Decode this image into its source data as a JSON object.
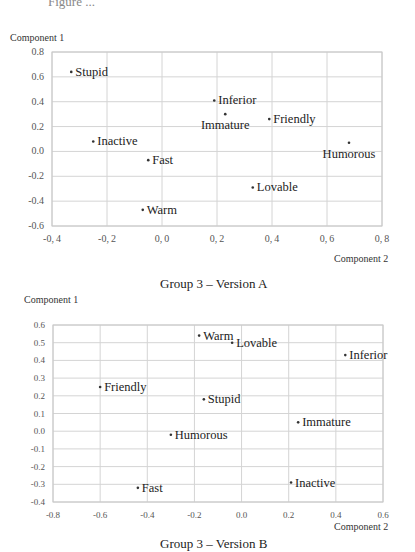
{
  "page": {
    "cutoff_text": "Figure ..."
  },
  "chart_data": [
    {
      "type": "scatter",
      "title": "Group 3 – Version A",
      "xlabel": "Component 2",
      "ylabel": "Component 1",
      "xlim": [
        -0.4,
        0.8
      ],
      "ylim": [
        -0.6,
        0.8
      ],
      "xticks": [
        "-0.4",
        "-0.2",
        "0.0",
        "0.2",
        "0.4",
        "0.6",
        "0.8"
      ],
      "yticks": [
        "0.8",
        "0.6",
        "0.4",
        "0.2",
        "0.0",
        "-0.2",
        "-0.4",
        "-0.6"
      ],
      "grid": true,
      "legend": null,
      "points": [
        {
          "label": "Stupid",
          "x": -0.33,
          "y": 0.64,
          "label_pos": "right"
        },
        {
          "label": "Inferior",
          "x": 0.19,
          "y": 0.41,
          "label_pos": "right"
        },
        {
          "label": "Immature",
          "x": 0.23,
          "y": 0.3,
          "label_pos": "below"
        },
        {
          "label": "Friendly",
          "x": 0.39,
          "y": 0.26,
          "label_pos": "right"
        },
        {
          "label": "Humorous",
          "x": 0.68,
          "y": 0.07,
          "label_pos": "below"
        },
        {
          "label": "Inactive",
          "x": -0.25,
          "y": 0.08,
          "label_pos": "right"
        },
        {
          "label": "Fast",
          "x": -0.05,
          "y": -0.07,
          "label_pos": "right"
        },
        {
          "label": "Lovable",
          "x": 0.33,
          "y": -0.29,
          "label_pos": "right"
        },
        {
          "label": "Warm",
          "x": -0.07,
          "y": -0.47,
          "label_pos": "right"
        }
      ]
    },
    {
      "type": "scatter",
      "title": "Group 3 – Version B",
      "xlabel": "Component 2",
      "ylabel": "Component 1",
      "xlim": [
        -0.8,
        0.6
      ],
      "ylim": [
        -0.4,
        0.6
      ],
      "xticks": [
        "-0.8",
        "-0.6",
        "-0.4",
        "-0.2",
        "0.0",
        "0.2",
        "0.4",
        "0.6"
      ],
      "yticks": [
        "0.6",
        "0.5",
        "0.4",
        "0.3",
        "0.2",
        "0.1",
        "0.0",
        "-0.1",
        "-0.2",
        "-0.3",
        "-0.4"
      ],
      "grid": true,
      "legend": null,
      "points": [
        {
          "label": "Warm",
          "x": -0.18,
          "y": 0.54,
          "label_pos": "right"
        },
        {
          "label": "Lovable",
          "x": -0.04,
          "y": 0.5,
          "label_pos": "right"
        },
        {
          "label": "Inferior",
          "x": 0.44,
          "y": 0.43,
          "label_pos": "right"
        },
        {
          "label": "Friendly",
          "x": -0.6,
          "y": 0.25,
          "label_pos": "right"
        },
        {
          "label": "Stupid",
          "x": -0.16,
          "y": 0.18,
          "label_pos": "right"
        },
        {
          "label": "Immature",
          "x": 0.24,
          "y": 0.05,
          "label_pos": "right"
        },
        {
          "label": "Humorous",
          "x": -0.3,
          "y": -0.02,
          "label_pos": "right"
        },
        {
          "label": "Fast",
          "x": -0.44,
          "y": -0.32,
          "label_pos": "right"
        },
        {
          "label": "Inactive",
          "x": 0.21,
          "y": -0.29,
          "label_pos": "right"
        }
      ]
    }
  ],
  "layout": [
    {
      "plot": {
        "left": 52,
        "top": 52,
        "right": 382,
        "bottom": 226
      },
      "ylabel_pos": {
        "left": 10,
        "top": 32
      },
      "xlabel_pos": {
        "left": 334,
        "top": 253
      },
      "caption_pos": {
        "left": 160,
        "top": 276
      },
      "tick_font": "10px",
      "tick_spacing_style": "spaced"
    },
    {
      "plot": {
        "left": 53,
        "top": 325,
        "right": 383,
        "bottom": 502
      },
      "ylabel_pos": {
        "left": 24,
        "top": 294
      },
      "xlabel_pos": {
        "left": 334,
        "top": 521
      },
      "caption_pos": {
        "left": 160,
        "top": 536
      },
      "tick_font": "9px",
      "tick_spacing_style": "normal"
    }
  ]
}
